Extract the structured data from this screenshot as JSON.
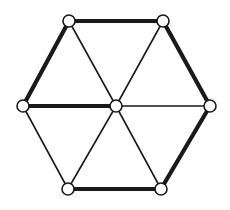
{
  "diagram": {
    "type": "graph",
    "colors": {
      "stroke": "#1a1a1a",
      "vertex_fill": "#ffffff",
      "background": "#ffffff"
    },
    "vertices": [
      {
        "id": "TL",
        "x": 69,
        "y": 21
      },
      {
        "id": "TR",
        "x": 163,
        "y": 21
      },
      {
        "id": "L",
        "x": 23,
        "y": 106
      },
      {
        "id": "C",
        "x": 116,
        "y": 106
      },
      {
        "id": "R",
        "x": 210,
        "y": 106
      },
      {
        "id": "BL",
        "x": 68,
        "y": 189
      },
      {
        "id": "BR",
        "x": 161,
        "y": 189
      }
    ],
    "vertex_radius": 6,
    "edges": [
      {
        "from": "TL",
        "to": "TR",
        "style": "thick"
      },
      {
        "from": "TL",
        "to": "L",
        "style": "thick"
      },
      {
        "from": "TR",
        "to": "R",
        "style": "thick"
      },
      {
        "from": "R",
        "to": "BR",
        "style": "thick"
      },
      {
        "from": "BL",
        "to": "BR",
        "style": "thick"
      },
      {
        "from": "L",
        "to": "C",
        "style": "thick"
      },
      {
        "from": "L",
        "to": "BL",
        "style": "thin"
      },
      {
        "from": "TL",
        "to": "C",
        "style": "thin"
      },
      {
        "from": "TR",
        "to": "C",
        "style": "thin"
      },
      {
        "from": "C",
        "to": "R",
        "style": "thin"
      },
      {
        "from": "C",
        "to": "BL",
        "style": "thin"
      },
      {
        "from": "C",
        "to": "BR",
        "style": "thin"
      }
    ]
  }
}
